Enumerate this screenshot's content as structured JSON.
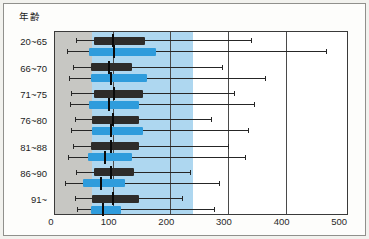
{
  "figure": {
    "y_axis_title": "年齢",
    "colors": {
      "black_bar": "#2e2c2a",
      "blue_bar": "#2f9cdc",
      "gray_band": "#c7c7c3",
      "blue_band": "#aed7f0",
      "grid_line": "#4a4a4a",
      "whisker": "#262626"
    }
  },
  "chart_data": {
    "type": "boxplot-horizontal",
    "title": "",
    "ylabel": "年齢",
    "xlabel": "",
    "xlim": [
      0,
      510
    ],
    "x_ticks": [
      "0",
      "100",
      "200",
      "300",
      "400",
      "500"
    ],
    "x_tick_values": [
      0,
      100,
      200,
      300,
      400,
      500
    ],
    "grid": {
      "vertical_at": [
        100,
        200,
        300,
        400
      ]
    },
    "legend": "none",
    "categories": [
      "20~65",
      "66~70",
      "71~75",
      "76~80",
      "81~88",
      "86~90",
      "91~"
    ],
    "bands": [
      {
        "name": "gray-reference-band",
        "from": 0,
        "to": 65,
        "color": "#c7c7c3"
      },
      {
        "name": "blue-reference-band",
        "from": 65,
        "to": 240,
        "color": "#aed7f0"
      }
    ],
    "series": [
      {
        "name": "series-black",
        "color": "#2e2c2a",
        "boxes": [
          {
            "category": "20~65",
            "min": 36,
            "q1": 67,
            "median": 101,
            "q3": 157,
            "max": 340
          },
          {
            "category": "66~70",
            "min": 31,
            "q1": 62,
            "median": 93,
            "q3": 134,
            "max": 290
          },
          {
            "category": "71~75",
            "min": 28,
            "q1": 67,
            "median": 103,
            "q3": 153,
            "max": 310
          },
          {
            "category": "76~80",
            "min": 34,
            "q1": 65,
            "median": 101,
            "q3": 145,
            "max": 270
          },
          {
            "category": "81~88",
            "min": 31,
            "q1": 62,
            "median": 98,
            "q3": 145,
            "max": 300
          },
          {
            "category": "86~90",
            "min": 36,
            "q1": 67,
            "median": 98,
            "q3": 137,
            "max": 235
          },
          {
            "category": "91~",
            "min": 34,
            "q1": 65,
            "median": 100,
            "q3": 145,
            "max": 220
          }
        ]
      },
      {
        "name": "series-blue",
        "color": "#2f9cdc",
        "boxes": [
          {
            "category": "20~65",
            "min": 20,
            "q1": 59,
            "median": 102,
            "q3": 176,
            "max": 470
          },
          {
            "category": "66~70",
            "min": 25,
            "q1": 62,
            "median": 98,
            "q3": 160,
            "max": 365
          },
          {
            "category": "71~75",
            "min": 26,
            "q1": 59,
            "median": 93,
            "q3": 145,
            "max": 345
          },
          {
            "category": "76~80",
            "min": 28,
            "q1": 65,
            "median": 98,
            "q3": 153,
            "max": 335
          },
          {
            "category": "81~88",
            "min": 22,
            "q1": 57,
            "median": 86,
            "q3": 134,
            "max": 330
          },
          {
            "category": "86~90",
            "min": 17,
            "q1": 48,
            "median": 79,
            "q3": 121,
            "max": 285
          },
          {
            "category": "91~",
            "min": 38,
            "q1": 62,
            "median": 83,
            "q3": 115,
            "max": 275
          }
        ]
      }
    ]
  }
}
